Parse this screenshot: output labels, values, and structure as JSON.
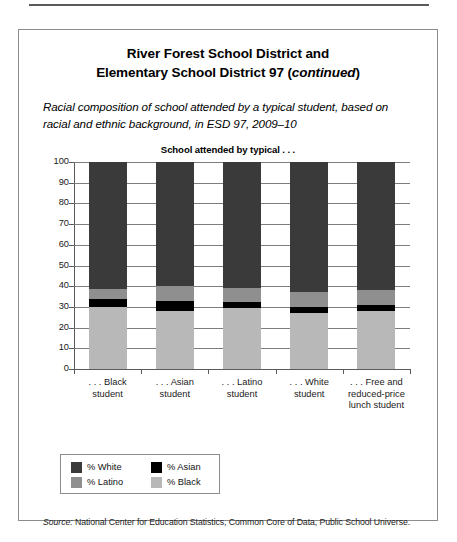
{
  "card": {
    "title_line1": "River Forest School District and",
    "title_line2_pre": "Elementary School District 97 (",
    "title_line2_ital": "continued",
    "title_line2_post": ")",
    "subtitle": "Racial composition of school attended by a typical student, based on racial and ethnic background, in ESD 97, 2009–10",
    "source_label": "Source:",
    "source_text": " National Center for Education Statistics, Common Core of Data, Public School Universe."
  },
  "legend": {
    "items": [
      {
        "label": "% White",
        "color": "#3a3a3a"
      },
      {
        "label": "% Asian",
        "color": "#000000"
      },
      {
        "label": "% Latino",
        "color": "#8f8f8f"
      },
      {
        "label": "% Black",
        "color": "#b8b8b8"
      }
    ]
  },
  "chart_data": {
    "type": "bar",
    "stacked": true,
    "title": "School attended by typical . . .",
    "xlabel": "",
    "ylabel": "",
    "ylim": [
      0,
      100
    ],
    "yticks": [
      0,
      10,
      20,
      30,
      40,
      50,
      60,
      70,
      80,
      90,
      100
    ],
    "ytick_labels": [
      "0",
      "10",
      "20",
      "30",
      "40",
      "50",
      "60",
      "70",
      "80",
      "90",
      "100"
    ],
    "grid": true,
    "legend_position": "below-left",
    "categories": [
      ". . . Black student",
      ". . . Asian student",
      ". . . Latino student",
      ". . . White student",
      ". . . Free and reduced-price lunch student"
    ],
    "category_lines": [
      [
        ". . . Black",
        "student"
      ],
      [
        ". . . Asian",
        "student"
      ],
      [
        ". . . Latino",
        "student"
      ],
      [
        ". . . White",
        "student"
      ],
      [
        ". . . Free and",
        "reduced-price",
        "lunch student"
      ]
    ],
    "series": [
      {
        "name": "% Black",
        "color": "#b8b8b8",
        "values": [
          30,
          28,
          29.5,
          27,
          28
        ]
      },
      {
        "name": "% Asian",
        "color": "#000000",
        "values": [
          4,
          5,
          3,
          3,
          3
        ]
      },
      {
        "name": "% Latino",
        "color": "#8f8f8f",
        "values": [
          4.5,
          7,
          6.5,
          7,
          7
        ]
      },
      {
        "name": "% White",
        "color": "#3a3a3a",
        "values": [
          61.5,
          60,
          61,
          63,
          62
        ]
      }
    ]
  }
}
